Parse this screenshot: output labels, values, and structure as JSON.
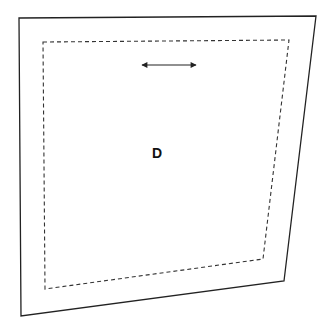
{
  "diagram": {
    "label": "D",
    "colors": {
      "stroke": "#222222",
      "background": "#ffffff"
    },
    "outer_quad": [
      [
        19,
        18
      ],
      [
        316,
        16
      ],
      [
        284,
        281
      ],
      [
        21,
        316
      ]
    ],
    "dashed_quad": [
      [
        43,
        42
      ],
      [
        289,
        40
      ],
      [
        263,
        259
      ],
      [
        45,
        289
      ]
    ],
    "arrow": {
      "from": [
        142,
        65
      ],
      "to": [
        196,
        65
      ],
      "type": "double-headed"
    },
    "label_position": [
      157,
      158
    ]
  }
}
